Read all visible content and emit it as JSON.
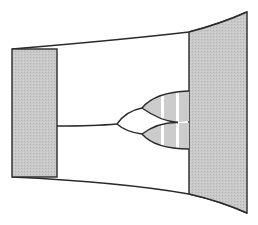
{
  "diagram": {
    "type": "bifurcation-diagram",
    "colors": {
      "stroke": "#2a2a2a",
      "panel_fill": "#c4c4c4",
      "branch_fill": "#cfcfcf",
      "stripe": "#ffffff",
      "background": "#ffffff"
    },
    "left_panel": {
      "x1": 12,
      "x2": 57,
      "y_top": 49,
      "y_bottom": 177
    },
    "right_panel": {
      "x_left": 189,
      "x_right": 247,
      "top_left_y": 32,
      "top_right_y": 12,
      "bottom_left_y": 194,
      "bottom_right_y": 213
    },
    "stem": {
      "from_x": 57,
      "to_x": 117,
      "y": 126
    },
    "branch_points": [
      {
        "name": "first-split",
        "x": 117,
        "y": 124
      },
      {
        "name": "upper-split",
        "x": 142,
        "y": 108
      },
      {
        "name": "lower-split",
        "x": 142,
        "y": 134
      }
    ],
    "stripes_x": [
      162,
      177
    ]
  }
}
